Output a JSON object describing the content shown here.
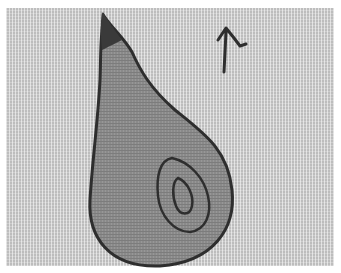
{
  "image": {
    "description": "Photograph of an appliquéd textile: a gray pear shape with dark stitched outline and an inner spiral, plus a small stitched mark at upper right, on a woven fabric background",
    "colors": {
      "background_fabric": "#bdbdbd",
      "pear_fill": "#8a8a8a",
      "stitch": "#2e2e2e",
      "border": "#ffffff"
    },
    "elements": [
      "pear-applique",
      "pear-stem",
      "inner-spiral",
      "stitched-mark"
    ]
  }
}
